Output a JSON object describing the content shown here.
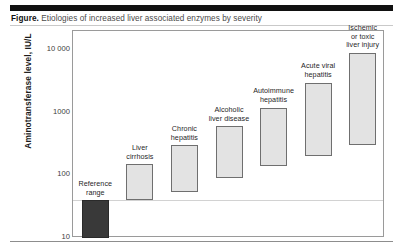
{
  "figure": {
    "caption_lead": "Figure.",
    "caption_text": " Etiologies of increased liver associated enzymes by severity"
  },
  "axis": {
    "y_title": "Aminotransferase level, IU/L",
    "y_ticks": [
      "10 000",
      "1000",
      "100",
      "10"
    ]
  },
  "colors": {
    "header_rule": "#111111",
    "bar_fill": "#e3e3e3",
    "bar_border": "#6f6f6f",
    "reference_fill": "#393939",
    "frame": "#9a9a9a",
    "gridline": "#d2d2d2"
  },
  "chart_data": {
    "type": "bar",
    "title": "Etiologies of increased liver associated enzymes by severity",
    "xlabel": "",
    "ylabel": "Aminotransferase level, IU/L",
    "yscale": "log",
    "ylim": [
      10,
      20000
    ],
    "ytick_values": [
      10000,
      1000,
      100,
      10
    ],
    "ytick_labels": [
      "10 000",
      "1000",
      "100",
      "10"
    ],
    "grid": true,
    "legend": "none",
    "note": "Floating range bars; each bar spans the low-to-high aminotransferase range for that etiology.",
    "categories": [
      "Reference range",
      "Liver cirrhosis",
      "Chronic hepatitis",
      "Alcoholic liver disease",
      "Autoimmune hepatitis",
      "Acute viral hepatitis",
      "Ischemic or toxic liver injury"
    ],
    "bars": [
      {
        "label": "Reference\nrange",
        "low": 10,
        "high": 40,
        "style": "dark"
      },
      {
        "label": "Liver\ncirrhosis",
        "low": 40,
        "high": 150,
        "style": "light"
      },
      {
        "label": "Chronic\nhepatitis",
        "low": 55,
        "high": 300,
        "style": "light"
      },
      {
        "label": "Alcoholic\nliver disease",
        "low": 90,
        "high": 600,
        "style": "light"
      },
      {
        "label": "Autoimmune\nhepatitis",
        "low": 140,
        "high": 1200,
        "style": "light"
      },
      {
        "label": "Acute viral\nhepatitis",
        "low": 200,
        "high": 3000,
        "style": "light"
      },
      {
        "label": "Ischemic\nor toxic\nliver injury",
        "low": 300,
        "high": 9000,
        "style": "light"
      }
    ]
  }
}
